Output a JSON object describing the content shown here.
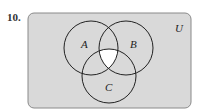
{
  "problem": {
    "number": "10."
  },
  "diagram": {
    "type": "venn-3-set",
    "universe_label": "U",
    "sets": [
      {
        "label": "A",
        "cx": 91,
        "cy": 48,
        "r": 27
      },
      {
        "label": "B",
        "cx": 126,
        "cy": 48,
        "r": 27
      },
      {
        "label": "C",
        "cx": 109,
        "cy": 76,
        "r": 27
      }
    ],
    "shaded_region": "complement of (A ∩ B ∩ C)",
    "unshaded_region": "A ∩ B ∩ C",
    "colors": {
      "shade": "#d9d9d9",
      "unshaded": "#ffffff",
      "stroke": "#222222",
      "border": "#8a8a8a"
    }
  }
}
